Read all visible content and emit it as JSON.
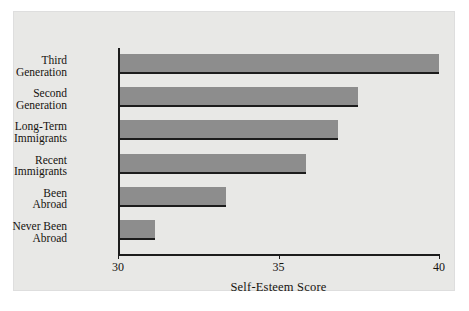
{
  "chart_data": {
    "type": "bar",
    "orientation": "horizontal",
    "title": "",
    "xlabel": "Self-Esteem Score",
    "ylabel": "",
    "xlim": [
      30,
      40
    ],
    "xticks": [
      30,
      35,
      40
    ],
    "xtick_labels": [
      "30",
      "35",
      "40"
    ],
    "grid": false,
    "legend": false,
    "categories": [
      "Third\nGeneration",
      "Second\nGeneration",
      "Long-Term\nImmigrants",
      "Recent\nImmigrants",
      "Been\nAbroad",
      "Never Been\nAbroad"
    ],
    "values": [
      39.95,
      37.4,
      36.8,
      35.8,
      33.3,
      31.1
    ],
    "bar_color": "#8d8d8d",
    "axis_color": "#1c1c1c",
    "background_color": "#e8e8e6"
  }
}
